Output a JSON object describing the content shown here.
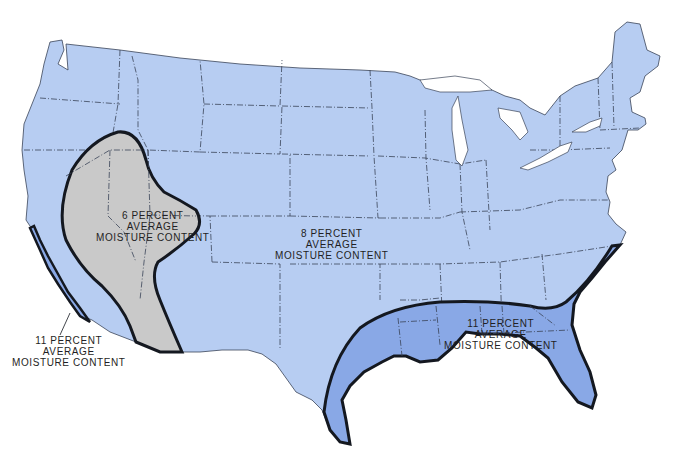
{
  "map": {
    "subject": "United States (contiguous)",
    "colors": {
      "background": "#ffffff",
      "zone_8_fill": "#b7cdf2",
      "zone_6_fill": "#c9c9c9",
      "zone_11_fill": "#89a8e6",
      "zone_boundary": "#141820",
      "state_border": "#3a4458"
    },
    "zones": [
      {
        "id": "zone-6",
        "label_lines": [
          "6 PERCENT",
          "AVERAGE",
          "MOISTURE CONTENT"
        ],
        "region": "Great Basin / Southwest interior (Nevada, Utah, Arizona, SE California)"
      },
      {
        "id": "zone-8",
        "label_lines": [
          "8 PERCENT",
          "AVERAGE",
          "MOISTURE CONTENT"
        ],
        "region": "Most of the interior and northern United States"
      },
      {
        "id": "zone-11-southeast",
        "label_lines": [
          "11 PERCENT",
          "AVERAGE",
          "MOISTURE CONTENT"
        ],
        "region": "Gulf Coast and Southeast"
      },
      {
        "id": "zone-11-california",
        "label_lines": [
          "11 PERCENT",
          "AVERAGE",
          "MOISTURE CONTENT"
        ],
        "region": "Southern California coastal strip"
      }
    ]
  }
}
